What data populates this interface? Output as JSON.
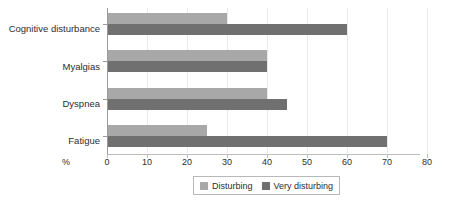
{
  "chart_data": {
    "type": "bar",
    "orientation": "horizontal",
    "title": "",
    "xlabel": "%",
    "ylabel": "",
    "categories": [
      "Cognitive disturbance",
      "Myalgias",
      "Dyspnea",
      "Fatigue"
    ],
    "series": [
      {
        "name": "Disturbing",
        "color": "#a8a8a8",
        "values": [
          30,
          40,
          40,
          25
        ]
      },
      {
        "name": "Very disturbing",
        "color": "#707070",
        "values": [
          60,
          40,
          45,
          70
        ]
      }
    ],
    "xlim": [
      0,
      80
    ],
    "xticks": [
      0,
      10,
      20,
      30,
      40,
      50,
      60,
      70,
      80
    ],
    "xtick_labels": [
      "0",
      "10",
      "20",
      "30",
      "40",
      "50",
      "60",
      "70",
      "80"
    ],
    "grid": true,
    "grid_axis": "x",
    "legend_position": "bottom-center"
  },
  "axis": {
    "unit_label": "%"
  },
  "legend": {
    "items": [
      {
        "label": "Disturbing"
      },
      {
        "label": "Very disturbing"
      }
    ]
  }
}
